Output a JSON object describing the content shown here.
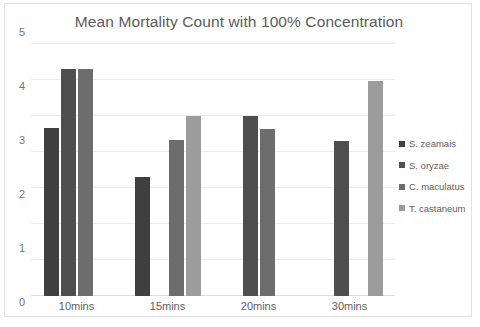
{
  "chart_data": {
    "type": "bar",
    "title": "Mean Mortality Count with 100% Concentration",
    "xlabel": "",
    "ylabel": "",
    "ylim": [
      0,
      7
    ],
    "yticks": [
      0,
      1,
      2,
      3,
      4,
      5,
      6,
      7
    ],
    "grid": true,
    "legend_position": "right",
    "categories": [
      "10mins",
      "15mins",
      "20mins",
      "30mins"
    ],
    "series": [
      {
        "name": "S. zeamais",
        "color": "#3f3f3f",
        "values": [
          4.67,
          3.31,
          null,
          null
        ]
      },
      {
        "name": "S. oryzae",
        "color": "#4f4f4f",
        "values": [
          6.3,
          null,
          5.0,
          4.31
        ]
      },
      {
        "name": "C. maculatus",
        "color": "#6d6d6d",
        "values": [
          6.3,
          4.33,
          4.65,
          null
        ]
      },
      {
        "name": "T. castaneum",
        "color": "#9c9c9c",
        "values": [
          null,
          5.0,
          null,
          5.98
        ]
      }
    ]
  },
  "legend": {
    "items": [
      {
        "label": "S. zeamais",
        "color": "#3f3f3f"
      },
      {
        "label": "S. oryzae",
        "color": "#4f4f4f"
      },
      {
        "label": "C. maculatus",
        "color": "#6d6d6d"
      },
      {
        "label": "T. castaneum",
        "color": "#9c9c9c"
      }
    ]
  },
  "axes": {
    "y_tick_labels": [
      "7",
      "6",
      "5",
      "4",
      "3",
      "2",
      "1",
      "0"
    ],
    "x_tick_labels": [
      "10mins",
      "15mins",
      "20mins",
      "30mins"
    ]
  },
  "colors": {
    "background": "#ffffff",
    "frame_border": "#e2e2e2",
    "gridline": "#ececec",
    "baseline": "#dedede",
    "title_text": "#5b5b5b",
    "tick_text": "#5d5d5d"
  }
}
